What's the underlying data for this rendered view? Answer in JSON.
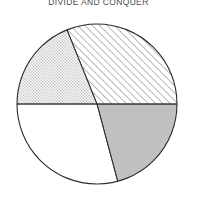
{
  "chart_data": {
    "type": "pie",
    "title": "DIVIDE AND CONQUER",
    "xlabel": "",
    "ylabel": "",
    "legend": "none",
    "grid": false,
    "center": {
      "x": 97,
      "y": 104
    },
    "radius": 80,
    "start_angle_deg": 180,
    "direction": "counterclockwise",
    "categories": [
      "Upper left",
      "Upper right",
      "Lower right",
      "Lower left"
    ],
    "values": [
      19,
      31,
      21,
      29
    ],
    "slices": [
      {
        "label": "Upper left",
        "value": 19,
        "fill": "dotted",
        "fill_color": "#ffffff",
        "start_deg": 180,
        "end_deg": 112
      },
      {
        "label": "Upper right",
        "value": 31,
        "fill": "hatched",
        "fill_color": "#ffffff",
        "start_deg": 112,
        "end_deg": 0
      },
      {
        "label": "Lower right",
        "value": 21,
        "fill": "solid",
        "fill_color": "#c0c0c0",
        "start_deg": 360,
        "end_deg": 285
      },
      {
        "label": "Lower left",
        "value": 29,
        "fill": "solid",
        "fill_color": "#ffffff",
        "start_deg": 285,
        "end_deg": 180
      }
    ]
  },
  "style": {
    "outline_color": "#2b2b2b",
    "outline_width": 1,
    "hatch_color": "#555555",
    "dot_color": "#b5b5b5",
    "gray_fill": "#c0c0c0",
    "white_fill": "#ffffff",
    "background": "#ffffff",
    "title_color": "#4a4a4a"
  }
}
